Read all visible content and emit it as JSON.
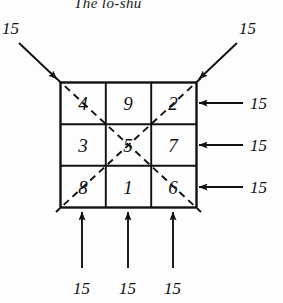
{
  "figure": {
    "title": "The lo-shu",
    "magic_constant": "15"
  },
  "grid": {
    "rows": [
      [
        "4",
        "9",
        "2"
      ],
      [
        "3",
        "5",
        "7"
      ],
      [
        "8",
        "1",
        "6"
      ]
    ]
  },
  "annotations": {
    "top_left_diagonal": "15",
    "top_right_diagonal": "15",
    "right_row_1": "15",
    "right_row_2": "15",
    "right_row_3": "15",
    "bottom_col_1": "15",
    "bottom_col_2": "15",
    "bottom_col_3": "15"
  },
  "colors": {
    "ink": "#111111",
    "background": "#fdfdfd"
  }
}
